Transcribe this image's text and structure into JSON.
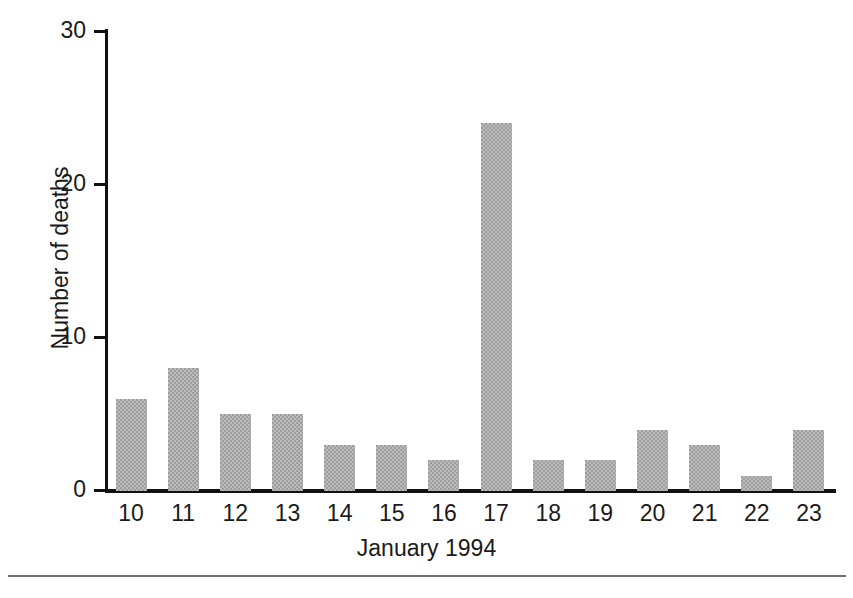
{
  "chart_data": {
    "type": "bar",
    "title": "",
    "subtitle": "",
    "xlabel": "January 1994",
    "ylabel": "Number of deaths",
    "categories": [
      "10",
      "11",
      "12",
      "13",
      "14",
      "15",
      "16",
      "17",
      "18",
      "19",
      "20",
      "21",
      "22",
      "23"
    ],
    "values": [
      6,
      8,
      5,
      5,
      3,
      3,
      2,
      24,
      2,
      2,
      4,
      3,
      1,
      4
    ],
    "series": [
      {
        "name": "Number of deaths",
        "values": [
          6,
          8,
          5,
          5,
          3,
          3,
          2,
          24,
          2,
          2,
          4,
          3,
          1,
          4
        ]
      }
    ],
    "ylim": [
      0,
      30
    ],
    "y_ticks": [
      0,
      10,
      20,
      30
    ],
    "y_tick_labels": [
      "0",
      "10",
      "20",
      "30"
    ],
    "grid": false,
    "legend": false,
    "legend_position": "none",
    "bar_color": "#9e9e9e",
    "axis_color": "#111111",
    "background_color": "#ffffff"
  },
  "axes": {
    "y_title": "Number of deaths",
    "x_title": "January 1994",
    "y_tick_labels": [
      "30",
      "20",
      "10",
      "0"
    ],
    "x_tick_labels": [
      "10",
      "11",
      "12",
      "13",
      "14",
      "15",
      "16",
      "17",
      "18",
      "19",
      "20",
      "21",
      "22",
      "23"
    ]
  },
  "caption": {
    "rule_present": "true",
    "fragment_text": ""
  }
}
